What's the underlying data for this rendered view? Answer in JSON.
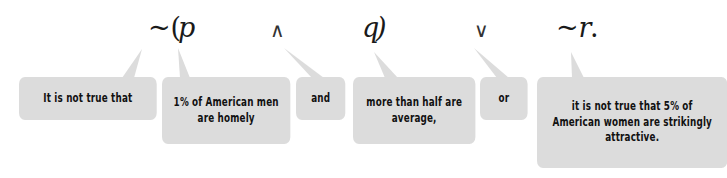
{
  "formula": {
    "neg_open": "~(",
    "p": "p",
    "and_symbol": "∧",
    "q": "q",
    "close": ")",
    "or_symbol": "∨",
    "neg_r": "~r",
    "period": "."
  },
  "callouts": [
    {
      "id": "negation",
      "text": "It is not true that"
    },
    {
      "id": "p",
      "text": "1% of American men are homely"
    },
    {
      "id": "and",
      "text": "and"
    },
    {
      "id": "q",
      "text": "more than half are average,"
    },
    {
      "id": "or",
      "text": "or"
    },
    {
      "id": "not-r",
      "text": "it is not true that 5% of American women are strikingly attractive."
    }
  ],
  "colors": {
    "callout_bg": "#dcdcdc",
    "text": "#111111"
  }
}
